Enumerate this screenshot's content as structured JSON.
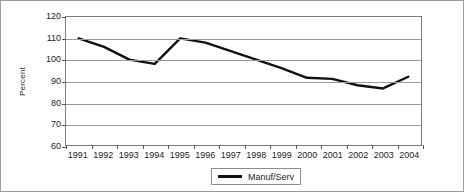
{
  "chart_data": {
    "type": "line",
    "title": "",
    "xlabel": "",
    "ylabel": "Percent",
    "categories": [
      "1991",
      "1992",
      "1993",
      "1994",
      "1995",
      "1996",
      "1997",
      "1998",
      "1999",
      "2000",
      "2001",
      "2002",
      "2003",
      "2004"
    ],
    "series": [
      {
        "name": "Manuf/Serv",
        "color": "#111111",
        "values": [
          110,
          106,
          100,
          98,
          110,
          108,
          104,
          100,
          96,
          91.5,
          91,
          88,
          86.5,
          92
        ]
      }
    ],
    "ylim": [
      60,
      120
    ],
    "yticks": [
      60,
      70,
      80,
      90,
      100,
      110,
      120
    ],
    "grid": "horizontal",
    "legend_position": "bottom-center"
  },
  "legend": {
    "entries": [
      {
        "label": "Manuf/Serv",
        "swatch": "line-swatch"
      }
    ]
  },
  "axes": {
    "y_axis_title": "Percent"
  }
}
